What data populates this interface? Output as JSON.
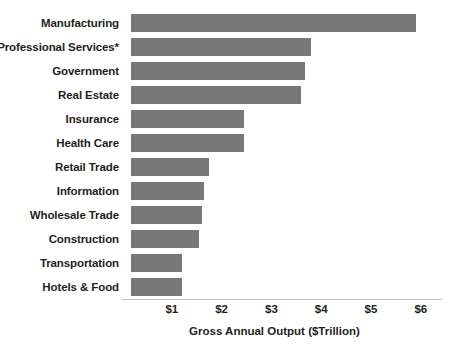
{
  "chart_data": {
    "type": "bar",
    "orientation": "horizontal",
    "title": "",
    "subtitle": "",
    "xlabel": "Gross Annual Output ($Trillion)",
    "ylabel": "",
    "xlim": [
      0,
      6
    ],
    "xticks": [
      1,
      2,
      3,
      4,
      5,
      6
    ],
    "xtick_labels": [
      "$1",
      "$2",
      "$3",
      "$4",
      "$5",
      "$6"
    ],
    "grid": false,
    "legend": null,
    "bar_color": "#787878",
    "text_color": "#231f20",
    "axis_color": "#bfbfbf",
    "categories": [
      "Manufacturing",
      "Professional Services*",
      "Government",
      "Real Estate",
      "Insurance",
      "Health Care",
      "Retail Trade",
      "Information",
      "Wholesale Trade",
      "Construction",
      "Transportation",
      "Hotels & Food"
    ],
    "values": [
      5.9,
      3.8,
      3.68,
      3.6,
      2.45,
      2.45,
      1.75,
      1.65,
      1.6,
      1.55,
      1.2,
      1.2
    ],
    "annotations": [
      "* asterisk on Professional Services category label"
    ]
  }
}
